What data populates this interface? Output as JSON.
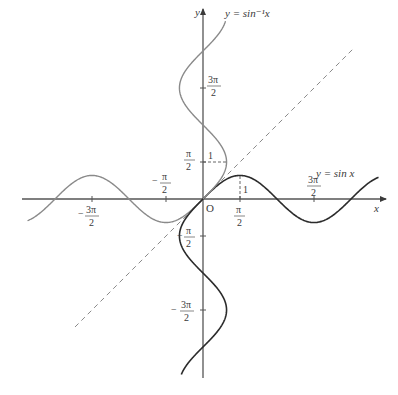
{
  "figure": {
    "type": "function-graph",
    "origin_label": "O",
    "axes": {
      "x_label": "x",
      "y_label": "y"
    },
    "curves": [
      {
        "name": "sin",
        "label": "y = sin x",
        "color_pos": "#2b2b2b",
        "color_neg": "#8a8a8a"
      },
      {
        "name": "arcsin",
        "label": "y = sin⁻¹x",
        "color_pos": "#8a8a8a",
        "color_neg": "#2b2b2b"
      },
      {
        "name": "identity",
        "label": "y = x",
        "style": "dashed",
        "color": "#8a8a8a"
      }
    ],
    "x_ticks": [
      {
        "num": "3π",
        "den": "2",
        "sign": "−",
        "value": -4.712
      },
      {
        "num": "π",
        "den": "2",
        "sign": "−",
        "value": -1.571
      },
      {
        "num": "π",
        "den": "2",
        "sign": "",
        "value": 1.571
      },
      {
        "num": "3π",
        "den": "2",
        "sign": "",
        "value": 4.712
      }
    ],
    "y_ticks": [
      {
        "num": "3π",
        "den": "2",
        "sign": "",
        "value": 4.712
      },
      {
        "num": "π",
        "den": "2",
        "sign": "",
        "value": 1.571
      },
      {
        "num": "π",
        "den": "2",
        "sign": "−",
        "value": -1.571
      },
      {
        "num": "3π",
        "den": "2",
        "sign": "−",
        "value": -4.712
      }
    ],
    "annotations": {
      "one_on_x": "1",
      "one_on_y": "1"
    }
  }
}
